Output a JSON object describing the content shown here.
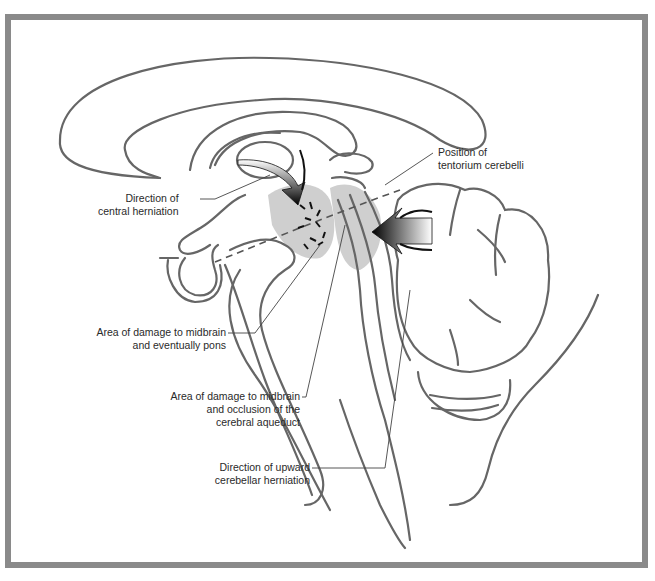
{
  "figure": {
    "frame_color": "#8a8a8a",
    "stroke_color": "#666666",
    "shade_color": "#cfcfcf",
    "arrow_color": "#111111"
  },
  "labels": {
    "central_herniation": [
      "Direction of",
      "central herniation"
    ],
    "tentorium": [
      "Position of",
      "tentorium cerebelli"
    ],
    "midbrain_pons": [
      "Area of damage to midbrain",
      "and eventually pons"
    ],
    "midbrain_aqueduct": [
      "Area of damage to midbrain",
      "and occlusion of the",
      "cerebral aqueduct"
    ],
    "upward_herniation": [
      "Direction of upward",
      "cerebellar herniation"
    ]
  }
}
